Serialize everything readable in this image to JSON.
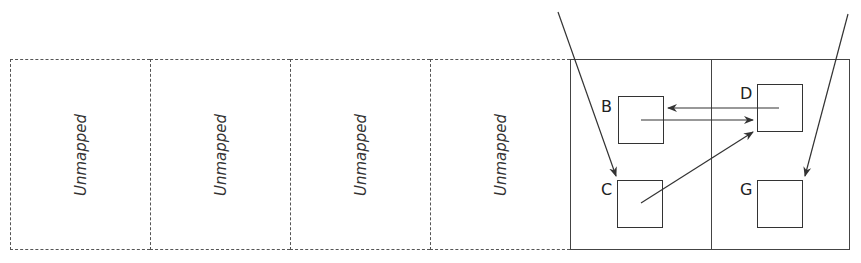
{
  "unmapped_pages": [
    {
      "label": "Unmapped"
    },
    {
      "label": "Unmapped"
    },
    {
      "label": "Unmapped"
    },
    {
      "label": "Unmapped"
    }
  ],
  "mapped_pages": [
    {
      "nodes": [
        "B",
        "C"
      ]
    },
    {
      "nodes": [
        "D",
        "G"
      ]
    }
  ],
  "nodes": {
    "B": {
      "label": "B"
    },
    "C": {
      "label": "C"
    },
    "D": {
      "label": "D"
    },
    "G": {
      "label": "G"
    }
  },
  "edges": [
    {
      "from": "external-left",
      "to": "C"
    },
    {
      "from": "external-right",
      "to": "G"
    },
    {
      "from": "B",
      "to": "D"
    },
    {
      "from": "D",
      "to": "B"
    },
    {
      "from": "C",
      "to": "D"
    }
  ],
  "colors": {
    "stroke": "#333333",
    "dashed": "#555555",
    "background": "#ffffff"
  }
}
